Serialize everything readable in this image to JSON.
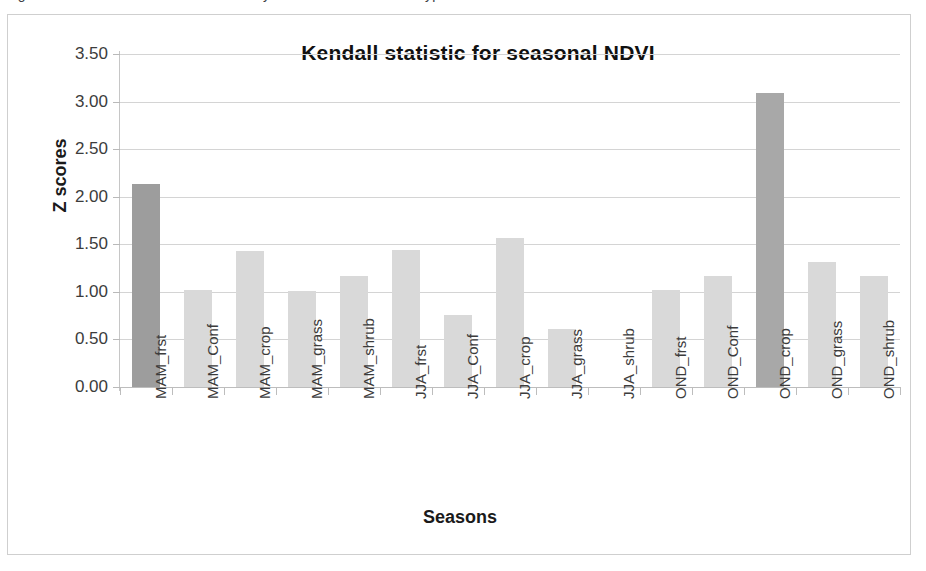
{
  "figure": {
    "caption_sliver": "Figure: Mann-Kendall trend test results by season and land cover type",
    "frame_border_color": "#cfcfcf",
    "background_color": "#ffffff"
  },
  "chart_data": {
    "type": "bar",
    "title": "Kendall statistic for seasonal NDVI",
    "xlabel": "Seasons",
    "ylabel": "Z scores",
    "ylim": [
      0.0,
      3.5
    ],
    "ytick_step": 0.5,
    "ytick_labels": [
      "0.00",
      "0.50",
      "1.00",
      "1.50",
      "2.00",
      "2.50",
      "3.00",
      "3.50"
    ],
    "ytick_values": [
      0.0,
      0.5,
      1.0,
      1.5,
      2.0,
      2.5,
      3.0,
      3.5
    ],
    "grid": true,
    "legend": false,
    "legend_position": "none",
    "categories": [
      "MAM_frst",
      "MAM_Conf",
      "MAM_crop",
      "MAM_grass",
      "MAM_shrub",
      "JJA_frst",
      "JJA_Conf",
      "JJA_crop",
      "JJA_grass",
      "JJA_shrub",
      "OND_frst",
      "OND_Conf",
      "OND_crop",
      "OND_grass",
      "OND_shrub"
    ],
    "values": [
      2.13,
      1.02,
      1.43,
      1.01,
      1.17,
      1.44,
      0.76,
      1.57,
      0.61,
      0.0,
      1.02,
      1.17,
      3.09,
      1.31,
      1.17
    ],
    "bar_colors": [
      "#9d9d9d",
      "#d9d9d9",
      "#d9d9d9",
      "#d9d9d9",
      "#d9d9d9",
      "#d9d9d9",
      "#d9d9d9",
      "#d9d9d9",
      "#d9d9d9",
      "#d9d9d9",
      "#d9d9d9",
      "#d9d9d9",
      "#a8a8a8",
      "#d9d9d9",
      "#d9d9d9"
    ],
    "highlight_color": "#9d9d9d",
    "default_bar_color": "#d9d9d9",
    "gridline_color": "#d4d4d4",
    "axis_color": "#bdbdbd"
  }
}
